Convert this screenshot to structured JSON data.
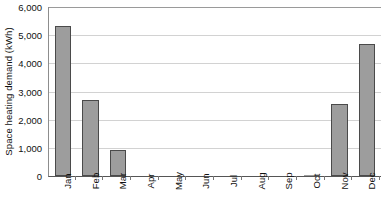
{
  "chart_data": {
    "type": "bar",
    "title": "",
    "subtitle": "",
    "xlabel": "",
    "ylabel": "Space heating demand (kWh)",
    "categories": [
      "Jan",
      "Feb",
      "Mar",
      "Apr",
      "May",
      "Jun",
      "Jul",
      "Aug",
      "Sep",
      "Oct",
      "Nov",
      "Dec"
    ],
    "values": [
      5340,
      2715,
      925,
      0,
      0,
      0,
      0,
      0,
      0,
      30,
      2550,
      4700
    ],
    "series": [
      {
        "name": "Space heating demand",
        "values": [
          5340,
          2715,
          925,
          0,
          0,
          0,
          0,
          0,
          0,
          30,
          2550,
          4700
        ]
      }
    ],
    "ylim": [
      0,
      6000
    ],
    "ytick_values": [
      0,
      1000,
      2000,
      3000,
      4000,
      5000,
      6000
    ],
    "ytick_labels": [
      "0",
      "1,000",
      "2,000",
      "3,000",
      "4,000",
      "5,000",
      "6,000"
    ],
    "grid": true,
    "grid_axis": "y",
    "legend": false,
    "legend_position": "none",
    "bar_fill_color": "#9d9d9d",
    "bar_edge_color": "#4a4a4a",
    "gridline_color": "#d2d2d2",
    "axis_color": "#555555",
    "xtick_label_rotation": 90
  }
}
